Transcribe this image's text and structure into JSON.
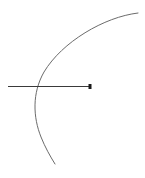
{
  "figure": {
    "canvas": {
      "width": 145,
      "height": 178,
      "background_color": "#ffffff"
    },
    "elements": {
      "arc": {
        "name": "circular-arc",
        "color": "#6b6b6b",
        "stroke_width": 1,
        "path": "M 138 13 C 104 17 62 42 44 72 C 32 93 33 117 41 137 C 45 147 50 156 55 164",
        "start_point": [
          138,
          13
        ],
        "vertex_point": [
          33,
          104
        ],
        "end_point": [
          55,
          164
        ],
        "opens_toward": "right"
      },
      "ray": {
        "name": "horizontal-ray",
        "color": "#3a3a3a",
        "stroke_width": 1,
        "start_point": [
          8,
          86.5
        ],
        "end_point": [
          91,
          86.5
        ],
        "length_px": 83,
        "orientation": "horizontal"
      },
      "endpoint_marker": {
        "name": "endpoint-dot",
        "color": "#1a1a1a",
        "shape": "square",
        "center": [
          90,
          86.5
        ],
        "width": 3,
        "height": 5
      },
      "intersection": {
        "name": "arc-ray-intersection",
        "point": [
          38,
          86.5
        ],
        "marked": false
      }
    }
  }
}
